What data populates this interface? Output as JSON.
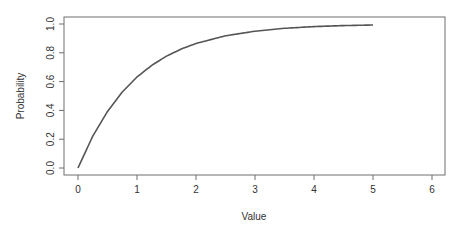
{
  "chart_data": {
    "type": "line",
    "title": "",
    "xlabel": "Value",
    "ylabel": "Probability",
    "xlim": [
      0,
      6
    ],
    "ylim": [
      0,
      1
    ],
    "x_ticks": [
      0,
      1,
      2,
      3,
      4,
      5,
      6
    ],
    "x_tick_labels": [
      "0",
      "1",
      "2",
      "3",
      "4",
      "5",
      "6"
    ],
    "y_ticks": [
      0.0,
      0.2,
      0.4,
      0.6,
      0.8,
      1.0
    ],
    "y_tick_labels": [
      "0.0",
      "0.2",
      "0.4",
      "0.6",
      "0.8",
      "1.0"
    ],
    "grid": false,
    "legend": null,
    "series": [
      {
        "name": "CDF",
        "color": "#555555",
        "x": [
          0,
          0.25,
          0.5,
          0.75,
          1,
          1.25,
          1.5,
          1.75,
          2,
          2.5,
          3,
          3.5,
          4,
          4.5,
          5
        ],
        "y": [
          0.0,
          0.221,
          0.393,
          0.528,
          0.632,
          0.713,
          0.777,
          0.826,
          0.865,
          0.918,
          0.95,
          0.97,
          0.982,
          0.989,
          0.993
        ]
      }
    ]
  },
  "colors": {
    "frame": "#6e6e6e",
    "line": "#555555",
    "text": "#333333"
  }
}
